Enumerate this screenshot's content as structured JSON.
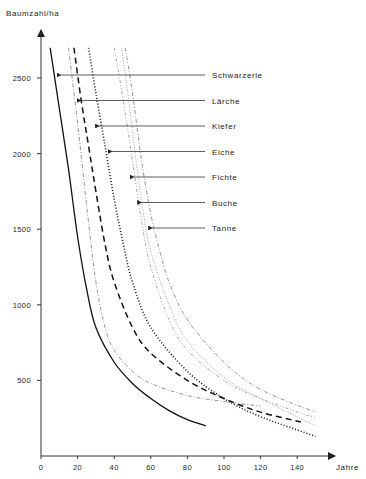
{
  "chart_data": {
    "type": "line",
    "title": "",
    "ylabel": "Baumzahl/ha",
    "xlabel": "Jahre",
    "xlim": [
      0,
      150
    ],
    "ylim": [
      0,
      2800
    ],
    "xticks": [
      0,
      20,
      40,
      60,
      80,
      100,
      120,
      140
    ],
    "yticks": [
      500,
      1000,
      1500,
      2000,
      2500
    ],
    "grid": false,
    "legend_position": "right, arrow-annotated labels",
    "series": [
      {
        "name": "Schwarzerle",
        "style": "solid",
        "x": [
          5,
          10,
          15,
          20,
          25,
          30,
          40,
          50,
          60,
          70,
          80,
          90
        ],
        "y": [
          2700,
          2300,
          1900,
          1450,
          1100,
          850,
          620,
          480,
          380,
          300,
          240,
          200
        ]
      },
      {
        "name": "Lärche",
        "style": "dashed",
        "x": [
          18,
          22,
          26,
          30,
          35,
          40,
          50,
          60,
          80,
          100,
          120,
          142
        ],
        "y": [
          2700,
          2350,
          2050,
          1750,
          1400,
          1150,
          850,
          680,
          500,
          380,
          290,
          225
        ]
      },
      {
        "name": "Kiefer",
        "style": "dotted",
        "x": [
          26,
          30,
          35,
          40,
          45,
          50,
          60,
          80,
          100,
          120,
          150
        ],
        "y": [
          2700,
          2400,
          2050,
          1700,
          1400,
          1150,
          850,
          560,
          380,
          260,
          130
        ]
      },
      {
        "name": "Eiche",
        "style": "dash-dot",
        "x": [
          15,
          20,
          25,
          30,
          35,
          40,
          50,
          60,
          80,
          100,
          120
        ],
        "y": [
          2700,
          2200,
          1650,
          1150,
          850,
          700,
          560,
          480,
          400,
          360,
          330
        ]
      },
      {
        "name": "Fichte",
        "style": "dash-dot-dot",
        "x": [
          40,
          45,
          50,
          55,
          60,
          70,
          80,
          100,
          120,
          150
        ],
        "y": [
          2700,
          2350,
          1950,
          1550,
          1250,
          900,
          700,
          500,
          380,
          250
        ]
      },
      {
        "name": "Buche",
        "style": "fine-dotted",
        "x": [
          44,
          48,
          52,
          56,
          60,
          70,
          80,
          100,
          120,
          150
        ],
        "y": [
          2700,
          2350,
          1950,
          1600,
          1350,
          1000,
          760,
          520,
          380,
          200
        ]
      },
      {
        "name": "Tanne",
        "style": "dash-dot",
        "x": [
          46,
          50,
          55,
          60,
          65,
          70,
          80,
          100,
          120,
          150
        ],
        "y": [
          2700,
          2400,
          1950,
          1600,
          1350,
          1150,
          900,
          620,
          440,
          290
        ]
      }
    ],
    "annotations": [
      {
        "label": "Schwarzerle",
        "arrow_to": [
          8,
          2500
        ]
      },
      {
        "label": "Lärche",
        "arrow_to": [
          19,
          2340
        ]
      },
      {
        "label": "Kiefer",
        "arrow_to": [
          29,
          2180
        ]
      },
      {
        "label": "Eiche",
        "arrow_to": [
          36,
          2010
        ]
      },
      {
        "label": "Fichte",
        "arrow_to": [
          48,
          1850
        ]
      },
      {
        "label": "Buche",
        "arrow_to": [
          52,
          1680
        ]
      },
      {
        "label": "Tanne",
        "arrow_to": [
          58,
          1510
        ]
      }
    ]
  },
  "axis": {
    "ylabel": "Baumzahl/ha",
    "xlabel": "Jahre"
  },
  "labels": [
    "Schwarzerle",
    "Lärche",
    "Kiefer",
    "Eiche",
    "Fichte",
    "Buche",
    "Tanne"
  ]
}
